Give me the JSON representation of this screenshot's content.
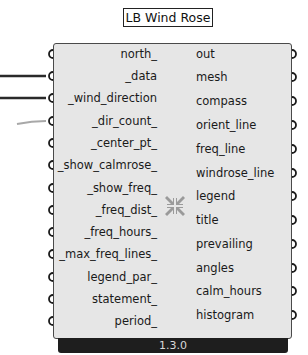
{
  "component": {
    "title": "LB Wind Rose",
    "version": "1.3.0",
    "icon": "compress-arrows-icon",
    "inputs": [
      {
        "label": "north_",
        "wired": false
      },
      {
        "label": "_data",
        "wired": true,
        "wire_color": "#2a2a2a"
      },
      {
        "label": "_wind_direction",
        "wired": true,
        "wire_color": "#2a2a2a"
      },
      {
        "label": "_dir_count_",
        "wired": true,
        "wire_color": "#a8a8a8"
      },
      {
        "label": "_center_pt_",
        "wired": false
      },
      {
        "label": "_show_calmrose_",
        "wired": false
      },
      {
        "label": "_show_freq_",
        "wired": false
      },
      {
        "label": "_freq_dist_",
        "wired": false
      },
      {
        "label": "_freq_hours_",
        "wired": false
      },
      {
        "label": "_max_freq_lines_",
        "wired": false
      },
      {
        "label": "legend_par_",
        "wired": false
      },
      {
        "label": "statement_",
        "wired": false
      },
      {
        "label": "period_",
        "wired": false
      }
    ],
    "outputs": [
      {
        "label": "out"
      },
      {
        "label": "mesh"
      },
      {
        "label": "compass"
      },
      {
        "label": "orient_line"
      },
      {
        "label": "freq_line"
      },
      {
        "label": "windrose_line"
      },
      {
        "label": "legend"
      },
      {
        "label": "title"
      },
      {
        "label": "prevailing"
      },
      {
        "label": "angles"
      },
      {
        "label": "calm_hours"
      },
      {
        "label": "histogram"
      }
    ]
  },
  "colors": {
    "body": "#e6e6e6",
    "border": "#4a4a4a",
    "footer": "#1e1e1e",
    "footer_text": "#d8d8d8",
    "text": "#1a1a1a",
    "icon": "#9a9a9a"
  }
}
